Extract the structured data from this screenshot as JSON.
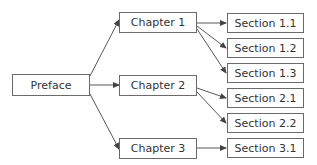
{
  "diagram": {
    "type": "tree",
    "root": {
      "id": "preface",
      "label": "Preface"
    },
    "chapters": [
      {
        "id": "ch1",
        "label": "Chapter 1"
      },
      {
        "id": "ch2",
        "label": "Chapter 2"
      },
      {
        "id": "ch3",
        "label": "Chapter 3"
      }
    ],
    "sections": [
      {
        "id": "s11",
        "label": "Section 1.1",
        "parent": "ch1"
      },
      {
        "id": "s12",
        "label": "Section 1.2",
        "parent": "ch1"
      },
      {
        "id": "s13",
        "label": "Section 1.3",
        "parent": "ch1"
      },
      {
        "id": "s21",
        "label": "Section 2.1",
        "parent": "ch2"
      },
      {
        "id": "s22",
        "label": "Section 2.2",
        "parent": "ch2"
      },
      {
        "id": "s31",
        "label": "Section 3.1",
        "parent": "ch3"
      }
    ],
    "edges": [
      [
        "preface",
        "ch1"
      ],
      [
        "preface",
        "ch2"
      ],
      [
        "preface",
        "ch3"
      ],
      [
        "ch1",
        "s11"
      ],
      [
        "ch1",
        "s12"
      ],
      [
        "ch1",
        "s13"
      ],
      [
        "ch2",
        "s21"
      ],
      [
        "ch2",
        "s22"
      ],
      [
        "ch3",
        "s31"
      ]
    ],
    "colors": {
      "border": "#6a6a6a",
      "text": "#333333",
      "edge": "#444444",
      "background": "#ffffff"
    }
  }
}
